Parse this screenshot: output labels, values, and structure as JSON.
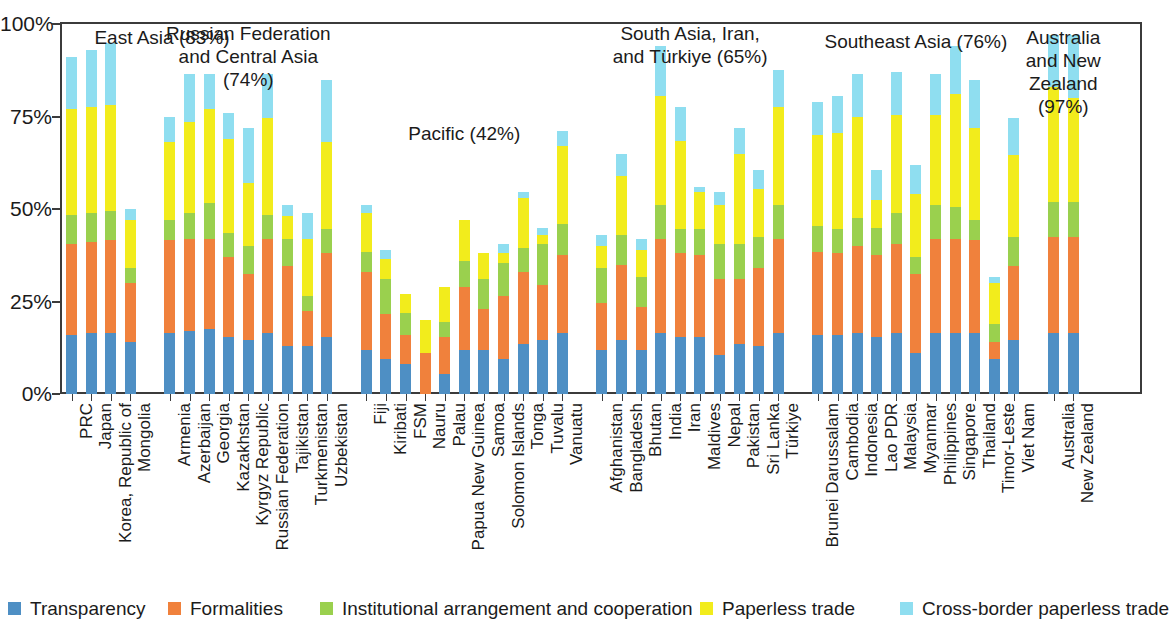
{
  "chart_data": {
    "type": "bar",
    "subtype": "stacked-bar",
    "title": "",
    "xlabel": "",
    "ylabel": "",
    "ylim": [
      0,
      100
    ],
    "ytick_labels": [
      "0%",
      "25%",
      "50%",
      "75%",
      "100%"
    ],
    "ytick_values": [
      0,
      25,
      50,
      75,
      100
    ],
    "grid": false,
    "legend_position": "bottom",
    "series": [
      {
        "name": "Transparency",
        "color": "#4e8fc4"
      },
      {
        "name": "Formalities",
        "color": "#f0813c"
      },
      {
        "name": "Institutional arrangement and cooperation",
        "color": "#9ad04e"
      },
      {
        "name": "Paperless trade",
        "color": "#f2ec1c"
      },
      {
        "name": "Cross-border paperless trade",
        "color": "#8fdef0"
      }
    ],
    "groups": [
      {
        "name": "East Asia",
        "average": "83%",
        "label": "East Asia (83%)",
        "economies": [
          {
            "name": "PRC",
            "values": [
              16.0,
              24.5,
              8.0,
              28.5,
              14.0
            ],
            "total": 91.0
          },
          {
            "name": "Japan",
            "values": [
              16.5,
              24.5,
              8.0,
              28.5,
              15.5
            ],
            "total": 93.0
          },
          {
            "name": "Korea, Republic of",
            "values": [
              16.5,
              25.0,
              8.0,
              28.5,
              17.0
            ],
            "total": 95.0
          },
          {
            "name": "Mongolia",
            "values": [
              14.0,
              16.0,
              4.0,
              13.0,
              3.0
            ],
            "total": 50.0
          }
        ]
      },
      {
        "name": "Russian Federation and Central Asia",
        "average": "74%",
        "label": "Russian Federation\nand Central Asia\n(74%)",
        "economies": [
          {
            "name": "Armenia",
            "values": [
              16.5,
              25.0,
              5.5,
              21.0,
              7.0
            ],
            "total": 75.0
          },
          {
            "name": "Azerbaijan",
            "values": [
              17.0,
              25.0,
              7.0,
              24.5,
              13.0
            ],
            "total": 86.5
          },
          {
            "name": "Georgia",
            "values": [
              17.5,
              24.5,
              9.5,
              25.5,
              9.5
            ],
            "total": 86.5
          },
          {
            "name": "Kazakhstan",
            "values": [
              15.5,
              21.5,
              6.5,
              25.5,
              7.0
            ],
            "total": 76.0
          },
          {
            "name": "Kyrgyz Republic",
            "values": [
              14.5,
              18.0,
              7.5,
              17.0,
              15.0
            ],
            "total": 72.0
          },
          {
            "name": "Russian Federation",
            "values": [
              16.5,
              25.5,
              6.5,
              26.0,
              12.0
            ],
            "total": 86.5
          },
          {
            "name": "Tajikistan",
            "values": [
              13.0,
              21.5,
              7.5,
              6.0,
              3.0
            ],
            "total": 51.0
          },
          {
            "name": "Turkmenistan",
            "values": [
              13.0,
              9.5,
              4.0,
              15.5,
              7.0
            ],
            "total": 49.0
          },
          {
            "name": "Uzbekistan",
            "values": [
              15.5,
              22.5,
              6.5,
              23.5,
              17.0
            ],
            "total": 85.0
          }
        ]
      },
      {
        "name": "Pacific",
        "average": "42%",
        "label": "Pacific (42%)",
        "economies": [
          {
            "name": "Fiji",
            "values": [
              12.0,
              21.0,
              5.5,
              10.5,
              2.0
            ],
            "total": 51.0
          },
          {
            "name": "Kiribati",
            "values": [
              9.5,
              12.0,
              9.5,
              5.5,
              2.5
            ],
            "total": 39.0
          },
          {
            "name": "FSM",
            "values": [
              8.0,
              8.0,
              6.0,
              5.0,
              0.0
            ],
            "total": 27.0
          },
          {
            "name": "Nauru",
            "values": [
              0.0,
              11.0,
              0.0,
              9.0,
              0.0
            ],
            "total": 20.0
          },
          {
            "name": "Palau",
            "values": [
              5.5,
              10.0,
              4.0,
              9.5,
              0.0
            ],
            "total": 29.0
          },
          {
            "name": "Papua New Guinea",
            "values": [
              12.0,
              17.0,
              7.0,
              11.0,
              0.0
            ],
            "total": 47.0
          },
          {
            "name": "Samoa",
            "values": [
              12.0,
              11.0,
              8.0,
              7.0,
              0.0
            ],
            "total": 38.0
          },
          {
            "name": "Solomon Islands",
            "values": [
              9.5,
              17.0,
              9.0,
              2.5,
              2.5
            ],
            "total": 40.5
          },
          {
            "name": "Tonga",
            "values": [
              13.5,
              19.5,
              6.5,
              13.5,
              1.5
            ],
            "total": 54.5
          },
          {
            "name": "Tuvalu",
            "values": [
              14.5,
              15.0,
              11.0,
              2.5,
              2.0
            ],
            "total": 45.0
          },
          {
            "name": "Vanuatu",
            "values": [
              16.5,
              21.0,
              8.5,
              21.0,
              4.0
            ],
            "total": 71.0
          }
        ]
      },
      {
        "name": "South Asia, Iran, and Türkiye",
        "average": "65%",
        "label": "South Asia, Iran,\nand Türkiye (65%)",
        "economies": [
          {
            "name": "Afghanistan",
            "values": [
              12.0,
              12.5,
              9.5,
              6.0,
              3.0
            ],
            "total": 43.0
          },
          {
            "name": "Bangladesh",
            "values": [
              14.5,
              20.5,
              8.0,
              16.0,
              6.0
            ],
            "total": 65.0
          },
          {
            "name": "Bhutan",
            "values": [
              12.0,
              11.5,
              8.0,
              7.5,
              3.0
            ],
            "total": 42.0
          },
          {
            "name": "India",
            "values": [
              16.5,
              25.5,
              9.0,
              29.5,
              13.5
            ],
            "total": 94.0
          },
          {
            "name": "Iran",
            "values": [
              15.5,
              22.5,
              6.5,
              24.0,
              9.0
            ],
            "total": 77.5
          },
          {
            "name": "Maldives",
            "values": [
              15.5,
              22.0,
              7.0,
              10.0,
              1.5
            ],
            "total": 56.0
          },
          {
            "name": "Nepal",
            "values": [
              10.5,
              20.5,
              9.5,
              10.5,
              3.5
            ],
            "total": 54.5
          },
          {
            "name": "Pakistan",
            "values": [
              13.5,
              17.5,
              9.5,
              24.5,
              7.0
            ],
            "total": 72.0
          },
          {
            "name": "Sri Lanka",
            "values": [
              13.0,
              21.0,
              8.5,
              13.0,
              5.0
            ],
            "total": 60.5
          },
          {
            "name": "Türkiye",
            "values": [
              16.5,
              25.5,
              9.0,
              26.5,
              10.0
            ],
            "total": 87.5
          }
        ]
      },
      {
        "name": "Southeast Asia",
        "average": "76%",
        "label": "Southeast Asia (76%)",
        "economies": [
          {
            "name": "Brunei Darussalam",
            "values": [
              16.0,
              22.5,
              7.0,
              24.5,
              9.0
            ],
            "total": 79.0
          },
          {
            "name": "Cambodia",
            "values": [
              16.0,
              22.0,
              6.5,
              26.0,
              10.0
            ],
            "total": 80.5
          },
          {
            "name": "Indonesia",
            "values": [
              16.5,
              23.5,
              7.5,
              27.5,
              11.5
            ],
            "total": 86.5
          },
          {
            "name": "Lao PDR",
            "values": [
              15.5,
              22.0,
              7.5,
              7.5,
              8.0
            ],
            "total": 60.5
          },
          {
            "name": "Malaysia",
            "values": [
              16.5,
              24.0,
              8.5,
              26.5,
              11.5
            ],
            "total": 87.0
          },
          {
            "name": "Myanmar",
            "values": [
              11.0,
              21.5,
              4.5,
              17.0,
              8.0
            ],
            "total": 62.0
          },
          {
            "name": "Philippines",
            "values": [
              16.5,
              25.5,
              9.0,
              24.5,
              11.0
            ],
            "total": 86.5
          },
          {
            "name": "Singapore",
            "values": [
              16.5,
              25.5,
              8.5,
              30.5,
              13.0
            ],
            "total": 94.0
          },
          {
            "name": "Thailand",
            "values": [
              16.5,
              25.0,
              5.5,
              25.0,
              13.0
            ],
            "total": 85.0
          },
          {
            "name": "Timor-Leste",
            "values": [
              9.5,
              4.5,
              5.0,
              11.0,
              1.5
            ],
            "total": 31.5
          },
          {
            "name": "Viet Nam",
            "values": [
              14.5,
              20.0,
              8.0,
              22.0,
              10.0
            ],
            "total": 74.5
          }
        ]
      },
      {
        "name": "Australia and New Zealand",
        "average": "97%",
        "label": "Australia\nand New\nZealand\n(97%)",
        "economies": [
          {
            "name": "Australia",
            "values": [
              16.5,
              26.0,
              9.5,
              31.0,
              14.0
            ],
            "total": 97.0
          },
          {
            "name": "New Zealand",
            "values": [
              16.5,
              26.0,
              9.5,
              28.0,
              17.0
            ],
            "total": 97.0
          }
        ]
      }
    ]
  },
  "legend": {
    "items": [
      {
        "label": "Transparency",
        "color": "#4e8fc4",
        "icon": "legend-swatch-blue"
      },
      {
        "label": "Formalities",
        "color": "#f0813c",
        "icon": "legend-swatch-orange"
      },
      {
        "label": "Institutional arrangement and cooperation",
        "color": "#9ad04e",
        "icon": "legend-swatch-green"
      },
      {
        "label": "Paperless trade",
        "color": "#f2ec1c",
        "icon": "legend-swatch-yellow"
      },
      {
        "label": "Cross-border paperless trade",
        "color": "#8fdef0",
        "icon": "legend-swatch-cyan"
      }
    ]
  }
}
